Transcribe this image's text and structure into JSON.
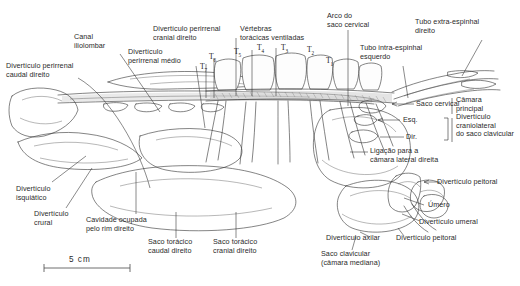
{
  "figure": {
    "scale": {
      "label": "5 cm",
      "units": "cm",
      "value": 5
    }
  },
  "vertebrae": {
    "group_label_line1": "Vértebras",
    "group_label_line2": "torácicas ventiladas",
    "ticks": [
      "T7",
      "T6",
      "T5",
      "T4",
      "T3",
      "T2",
      "T1"
    ]
  },
  "labels": {
    "perirrenal_caudal": "Divertículo perirrenal\ncaudal direito",
    "canal_iliolombar": "Canal\niliolombar",
    "perirrenal_medio": "Divertículo\nperirrenal médio",
    "perirrenal_cranial": "Divertículo perirrenal\ncranial direito",
    "arco_saco_cervical": "Arco do\nsaco cervical",
    "tubo_intra_espinhal": "Tubo intra-espinhal\nesquerdo",
    "tubo_extra_espinhal": "Tubo extra-espinhal\ndireito",
    "saco_cervical": "Saco cervical",
    "camara_principal": "Câmara\nprincipal",
    "esq": "Esq.",
    "dir": "Dir.",
    "diverticulo_craniolateral": "Divertículo\ncraniolateral\ndo saco clavicular",
    "ligacao_camara_lateral": "Ligação para a\ncâmara lateral direita",
    "diverticulo_peitoral_top": "Divertículo peitoral",
    "umero": "Úmero",
    "diverticulo_umeral": "Divertículo umeral",
    "diverticulo_peitoral_bottom": "Divertículo peitoral",
    "diverticulo_axilar": "Divertículo axilar",
    "saco_clavicular": "Saco clavicular\n(câmara mediana)",
    "saco_toracico_cranial": "Saco torácico\ncranial direito",
    "saco_toracico_caudal": "Saco torácico\ncaudal direito",
    "cavidade_rim": "Cavidade ocupada\npelo rim direito",
    "diverticulo_crural": "Divertículo\ncrural",
    "diverticulo_isquiatico": "Divertículo\nisquiático"
  },
  "colors": {
    "background": "#ffffff",
    "ink": "#2b2b2b",
    "line": "#333333",
    "shade": "#d9d9d9"
  }
}
